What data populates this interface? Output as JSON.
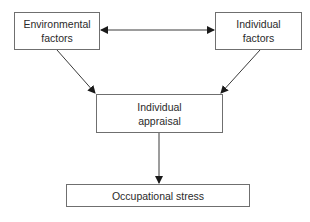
{
  "diagram": {
    "nodes": {
      "environmental": {
        "label": "Environmental\nfactors"
      },
      "individual": {
        "label": "Individual\nfactors"
      },
      "appraisal": {
        "label": "Individual\nappraisal"
      },
      "outcome": {
        "label": "Occupational stress"
      }
    },
    "edges": [
      {
        "from": "Environmental factors",
        "to": "Individual factors",
        "type": "bidirectional"
      },
      {
        "from": "Environmental factors",
        "to": "Individual appraisal",
        "type": "directed"
      },
      {
        "from": "Individual factors",
        "to": "Individual appraisal",
        "type": "directed"
      },
      {
        "from": "Individual appraisal",
        "to": "Occupational stress",
        "type": "directed"
      }
    ],
    "colors": {
      "line": "#3a3a3a",
      "border": "#6f6f6f",
      "background": "#ffffff"
    }
  }
}
